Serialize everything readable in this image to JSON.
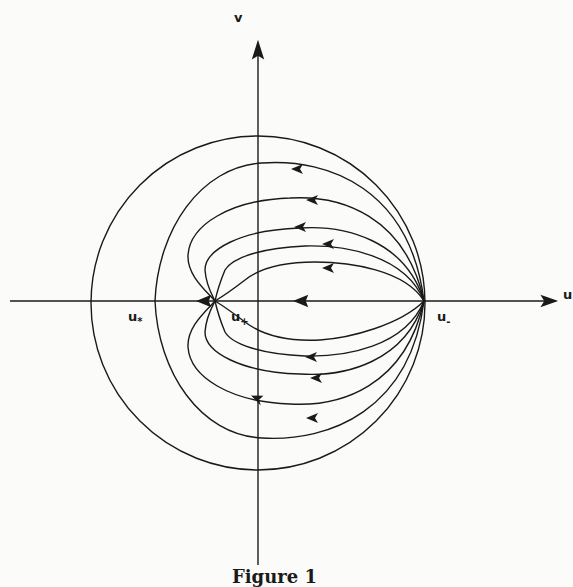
{
  "figure": {
    "caption": "Figure 1",
    "axes": {
      "x_label": "u",
      "y_label": "v"
    },
    "points": [
      {
        "name": "u_star",
        "base": "u",
        "sub": "*"
      },
      {
        "name": "u_plus",
        "base": "u",
        "sub": "+"
      },
      {
        "name": "u_minus",
        "base": "u",
        "sub": "-"
      }
    ]
  }
}
